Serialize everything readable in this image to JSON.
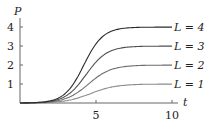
{
  "chart_data": {
    "type": "line",
    "title": "",
    "xlabel": "t",
    "ylabel": "P",
    "xlim": [
      0,
      10.5
    ],
    "ylim": [
      0,
      4.3
    ],
    "xticks": [
      5,
      10
    ],
    "yticks": [
      1,
      2,
      3,
      4
    ],
    "grid": false,
    "legend_position": "inline-right",
    "x": [
      0,
      1,
      2,
      3,
      4,
      5,
      6,
      7,
      8,
      9,
      10
    ],
    "series": [
      {
        "name": "L = 1",
        "values": [
          0.0,
          0.02,
          0.08,
          0.2,
          0.4,
          0.62,
          0.8,
          0.91,
          0.96,
          0.99,
          1.0
        ]
      },
      {
        "name": "L = 2",
        "values": [
          0.0,
          0.03,
          0.12,
          0.35,
          0.75,
          1.2,
          1.58,
          1.82,
          1.94,
          1.98,
          2.0
        ]
      },
      {
        "name": "L = 3",
        "values": [
          0.0,
          0.03,
          0.15,
          0.45,
          1.05,
          1.8,
          2.4,
          2.75,
          2.92,
          2.98,
          3.0
        ]
      },
      {
        "name": "L = 4",
        "values": [
          0.0,
          0.03,
          0.17,
          0.55,
          1.3,
          2.35,
          3.2,
          3.67,
          3.88,
          3.97,
          4.0
        ]
      }
    ],
    "colors": [
      "#8a8a8a",
      "#6e6e6e",
      "#505050",
      "#2a2a2a"
    ]
  },
  "labels": {
    "y_axis": "P",
    "x_axis": "t",
    "yticks": [
      "1",
      "2",
      "3",
      "4"
    ],
    "xticks": [
      "5",
      "10"
    ],
    "series": [
      "L = 1",
      "L = 2",
      "L = 3",
      "L = 4"
    ]
  }
}
